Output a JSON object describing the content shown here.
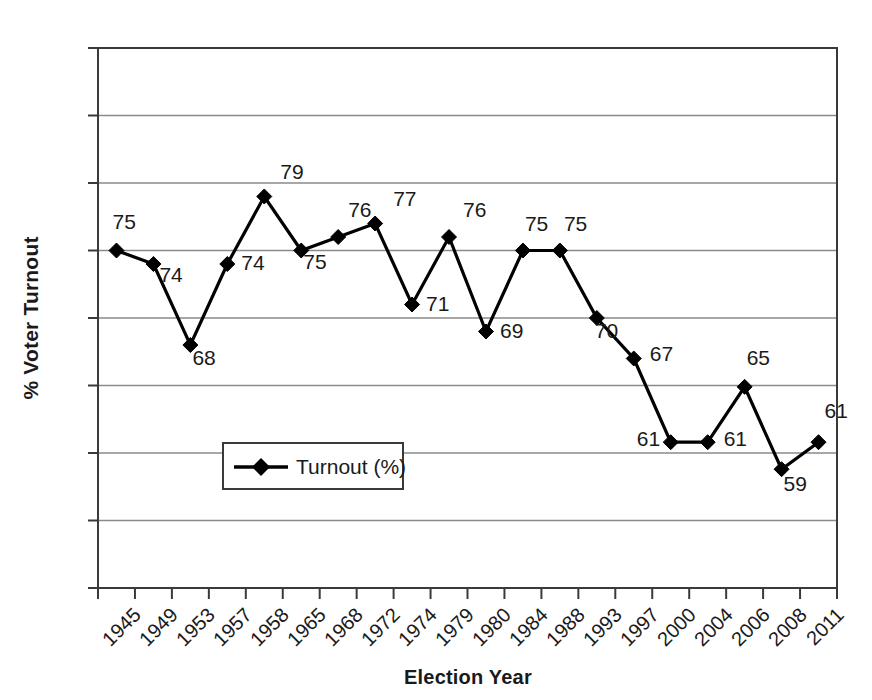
{
  "chart_data": {
    "type": "line",
    "title": "",
    "xlabel": "Election Year",
    "ylabel": "% Voter Turnout",
    "ylim": [
      50,
      90
    ],
    "ytick_step": 5,
    "yticks": [
      90,
      85,
      80,
      75,
      70,
      65,
      60,
      55,
      50
    ],
    "grid": "horizontal",
    "legend_position": "inside-lower-left",
    "legend": [
      "Turnout (%)"
    ],
    "marker": "diamond",
    "line_color": "#000000",
    "categories": [
      "1945",
      "1949",
      "1953",
      "1957",
      "1958",
      "1965",
      "1968",
      "1972",
      "1974",
      "1979",
      "1980",
      "1984",
      "1988",
      "1993",
      "1997",
      "2000",
      "2004",
      "2006",
      "2008",
      "2011"
    ],
    "series": [
      {
        "name": "Turnout (%)",
        "values": [
          75,
          74,
          68,
          74,
          79,
          75,
          76,
          77,
          71,
          76,
          69,
          75,
          75,
          70,
          67,
          60.8,
          60.8,
          64.9,
          58.8,
          60.8
        ],
        "labels": [
          "75",
          "74",
          "68",
          "74",
          "79",
          "75",
          "76",
          "77",
          "71",
          "76",
          "69",
          "75",
          "75",
          "70",
          "67",
          "61",
          "61",
          "65",
          "59",
          "61"
        ]
      }
    ]
  },
  "axes": {
    "y_title": "% Voter Turnout",
    "x_title": "Election Year",
    "ytick_labels": [
      "90",
      "85",
      "80",
      "75",
      "70",
      "65",
      "60",
      "55",
      "50"
    ],
    "xtick_labels": [
      "1945",
      "1949",
      "1953",
      "1957",
      "1958",
      "1965",
      "1968",
      "1972",
      "1974",
      "1979",
      "1980",
      "1984",
      "1988",
      "1993",
      "1997",
      "2000",
      "2004",
      "2006",
      "2008",
      "2011"
    ]
  },
  "legend": {
    "entry_label": "Turnout (%)"
  },
  "colors": {
    "line": "#000000",
    "marker": "#000000",
    "grid": "#8a8a8a",
    "axis": "#3a3a3a",
    "text": "#1a1a1a",
    "background": "#ffffff"
  }
}
